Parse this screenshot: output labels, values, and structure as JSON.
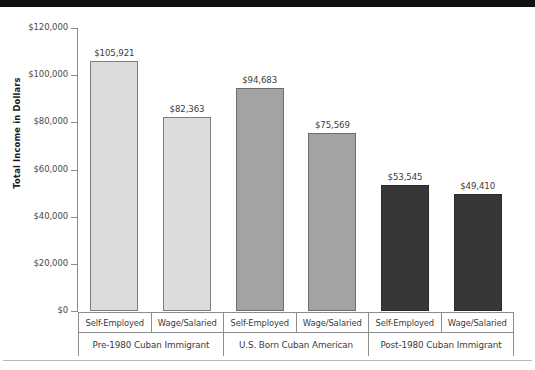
{
  "chart_data": {
    "type": "bar",
    "title": "",
    "subtitle": "",
    "xlabel": "",
    "ylabel": "Total Income in Dollars",
    "ylim": [
      0,
      120000
    ],
    "grid": false,
    "legend_position": "none",
    "y_ticks": [
      {
        "value": 120000,
        "label": "$120,000"
      },
      {
        "value": 100000,
        "label": "$100,000"
      },
      {
        "value": 80000,
        "label": "$80,000"
      },
      {
        "value": 60000,
        "label": "$60,000"
      },
      {
        "value": 40000,
        "label": "$40,000"
      },
      {
        "value": 20000,
        "label": "$20,000"
      },
      {
        "value": 0,
        "label": "$0"
      }
    ],
    "groups": [
      {
        "label": "Pre-1980 Cuban Immigrant",
        "shade": "shade-light",
        "color": "#dcdcdc"
      },
      {
        "label": "U.S. Born Cuban American",
        "shade": "shade-medium",
        "color": "#a3a3a3"
      },
      {
        "label": "Post-1980 Cuban Immigrant",
        "shade": "shade-dark",
        "color": "#373737"
      }
    ],
    "categories": [
      "Self-Employed",
      "Wage/Salaried",
      "Self-Employed",
      "Wage/Salaried",
      "Self-Employed",
      "Wage/Salaried"
    ],
    "bars": [
      {
        "category": "Self-Employed",
        "group": "Pre-1980 Cuban Immigrant",
        "value": 105921,
        "label": "$105,921",
        "shade": "shade-light"
      },
      {
        "category": "Wage/Salaried",
        "group": "Pre-1980 Cuban Immigrant",
        "value": 82363,
        "label": "$82,363",
        "shade": "shade-light"
      },
      {
        "category": "Self-Employed",
        "group": "U.S. Born Cuban American",
        "value": 94683,
        "label": "$94,683",
        "shade": "shade-medium"
      },
      {
        "category": "Wage/Salaried",
        "group": "U.S. Born Cuban American",
        "value": 75569,
        "label": "$75,569",
        "shade": "shade-medium"
      },
      {
        "category": "Self-Employed",
        "group": "Post-1980 Cuban Immigrant",
        "value": 53545,
        "label": "$53,545",
        "shade": "shade-dark"
      },
      {
        "category": "Wage/Salaried",
        "group": "Post-1980 Cuban Immigrant",
        "value": 49410,
        "label": "$49,410",
        "shade": "shade-dark"
      }
    ],
    "values": [
      105921,
      82363,
      94683,
      75569,
      53545,
      49410
    ],
    "colors": {
      "bar_light": "#dcdcdc",
      "bar_medium": "#a3a3a3",
      "bar_dark": "#373737",
      "axis": "#8c8c8c",
      "text": "#3b3b3b",
      "top_band": "#111111",
      "bottom_rule": "#b6b6b6"
    }
  }
}
